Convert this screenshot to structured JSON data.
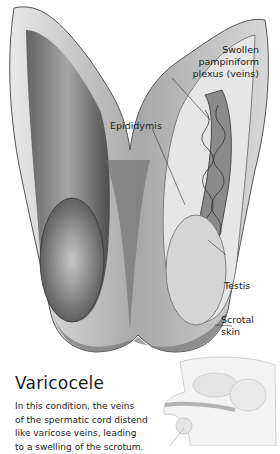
{
  "figure": {
    "labels": {
      "plexus": [
        "Swollen",
        "pampiniform",
        "plexus (veins)"
      ],
      "epididymis": "Epididymis",
      "testis": "Testis",
      "scrotal": [
        "Scrotal",
        "skin"
      ]
    },
    "title": "Varicocele",
    "description_lines": [
      "In this condition, the veins",
      "of the spermatic cord distend",
      "like varicose veins, leading",
      "to a swelling of the scrotum."
    ]
  }
}
